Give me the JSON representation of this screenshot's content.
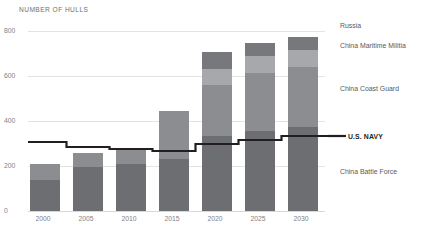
{
  "chart_data": {
    "type": "bar",
    "title": "NUMBER OF HULLS",
    "xlabel": "",
    "ylabel": "NUMBER OF HULLS",
    "ylim": [
      0,
      900
    ],
    "yticks": [
      0,
      200,
      400,
      600,
      800
    ],
    "ytick_labels": [
      "0",
      "200",
      "400",
      "600",
      "800"
    ],
    "grid": true,
    "legend_position": "right",
    "stacked": true,
    "categories": [
      "2000",
      "2005",
      "2010",
      "2015",
      "2020",
      "2025",
      "2030"
    ],
    "series": [
      {
        "name": "China Battle Force",
        "color": "#6d6e71",
        "values": [
          155,
          220,
          235,
          260,
          375,
          400,
          420
        ]
      },
      {
        "name": "China Coast Guard",
        "color": "#8c8d90",
        "values": [
          80,
          70,
          75,
          240,
          255,
          290,
          300
        ]
      },
      {
        "name": "China Maritime Militia",
        "color": "#a6a8ab",
        "values": [
          0,
          0,
          0,
          0,
          80,
          85,
          85
        ]
      },
      {
        "name": "Russia",
        "color": "#77787b",
        "values": [
          0,
          0,
          0,
          0,
          85,
          65,
          65
        ]
      }
    ],
    "overlay_line": {
      "name": "U.S. NAVY",
      "color": "#231f20",
      "style": "step",
      "values": [
        345,
        320,
        310,
        300,
        335,
        355,
        375
      ]
    },
    "totals": [
      235,
      290,
      310,
      500,
      795,
      840,
      870
    ]
  },
  "axis": {
    "title": "NUMBER OF HULLS"
  },
  "legend": {
    "items": [
      {
        "label": "Russia",
        "color": "#77787b",
        "bold": false
      },
      {
        "label": "China Maritime Militia",
        "color": "#a6a8ab",
        "bold": false
      },
      {
        "label": "China Coast Guard",
        "color": "#8c8d90",
        "bold": false
      },
      {
        "label": "U.S. NAVY",
        "color": "#231f20",
        "bold": true
      },
      {
        "label": "China Battle Force",
        "color": "#6d6e71",
        "bold": false
      }
    ]
  },
  "colors": {
    "background": "#ffffff",
    "gridline": "#e3e3e3",
    "tick_text": "#808285",
    "legend_text": "#58595b",
    "navy_line": "#231f20"
  }
}
